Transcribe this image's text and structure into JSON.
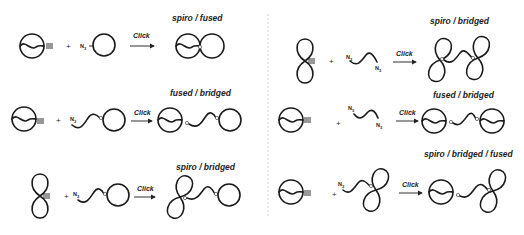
{
  "scheme": {
    "operator_plus": "+",
    "arrow_label": "Click",
    "azide_label": "N",
    "azide_subscript": "3",
    "left_column": [
      {
        "row": 1,
        "reactant_a": "macrocycle-with-alkyne",
        "reactant_b": "azido-ring",
        "product_label": "spiro / fused"
      },
      {
        "row": 2,
        "reactant_a": "macrocycle-with-alkyne",
        "reactant_b": "azido-linker-ring",
        "product_label": "fused / bridged"
      },
      {
        "row": 3,
        "reactant_a": "figure-eight-with-alkyne",
        "reactant_b": "azido-linker-ring",
        "product_label": "spiro / bridged"
      }
    ],
    "right_column": [
      {
        "row": 1,
        "reactant_a": "figure-eight-with-alkyne",
        "reactant_b": "diazido-linker",
        "product_label": "spiro / bridged"
      },
      {
        "row": 2,
        "reactant_a": "macrocycle-with-alkyne",
        "reactant_b": "diazido-linker",
        "product_label": "fused / bridged"
      },
      {
        "row": 3,
        "reactant_a": "macrocycle-with-alkyne",
        "reactant_b": "azido-linker-figure-eight",
        "product_label": "spiro / bridged / fused"
      }
    ]
  }
}
